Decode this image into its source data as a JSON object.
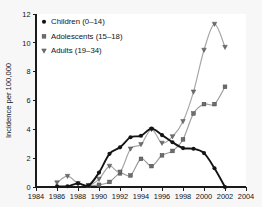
{
  "figure": {
    "background_color": "#f7f7f7",
    "plot_background_color": "#ffffff"
  },
  "chart_data": {
    "type": "line",
    "title": "",
    "subtitle": "",
    "xlabel": "",
    "ylabel": "Incidence per 100,000",
    "xlim": [
      1984,
      2004
    ],
    "ylim": [
      0,
      12
    ],
    "xticks": [
      1984,
      1986,
      1988,
      1990,
      1992,
      1994,
      1996,
      1998,
      2000,
      2002,
      2004
    ],
    "xtick_labels": [
      "1984",
      "1986",
      "1988",
      "1990",
      "1992",
      "1994",
      "1996",
      "1998",
      "2000",
      "2002",
      "2004"
    ],
    "yticks": [
      0,
      2,
      4,
      6,
      8,
      10,
      12
    ],
    "ytick_labels": [
      "0",
      "2",
      "4",
      "6",
      "8",
      "10",
      "12"
    ],
    "grid": false,
    "legend_position": "upper-left",
    "series": [
      {
        "name": "Children (0–14)",
        "marker": "circle",
        "color": "#141414",
        "x": [
          1986,
          1987,
          1988,
          1989,
          1990,
          1991,
          1992,
          1993,
          1994,
          1995,
          1996,
          1997,
          1998,
          1999,
          2000,
          2001,
          2002
        ],
        "values": [
          0.05,
          0.05,
          0.25,
          0.1,
          1.0,
          2.3,
          2.75,
          3.45,
          3.55,
          4.05,
          3.6,
          3.1,
          2.7,
          2.65,
          2.35,
          1.3,
          0.0
        ]
      },
      {
        "name": "Adolescents (15–18)",
        "marker": "square",
        "color": "#6d6d6d",
        "x": [
          1989,
          1990,
          1991,
          1992,
          1993,
          1994,
          1995,
          1996,
          1997,
          1998,
          1999,
          2000,
          2001,
          2002
        ],
        "values": [
          0.1,
          0.15,
          0.35,
          0.95,
          0.8,
          1.95,
          1.45,
          2.2,
          2.5,
          3.3,
          5.1,
          5.75,
          5.75,
          6.95
        ]
      },
      {
        "name": "Adults (19–34)",
        "marker": "triangle-down",
        "color": "#707070",
        "x": [
          1986,
          1987,
          1988,
          1989,
          1990,
          1991,
          1992,
          1993,
          1994,
          1995,
          1996,
          1997,
          1998,
          1999,
          2000,
          2001,
          2002
        ],
        "values": [
          0.3,
          0.75,
          0.25,
          0.1,
          0.55,
          1.45,
          1.05,
          2.65,
          2.95,
          4.0,
          3.05,
          3.5,
          4.55,
          6.6,
          9.5,
          11.3,
          9.7
        ]
      }
    ]
  }
}
